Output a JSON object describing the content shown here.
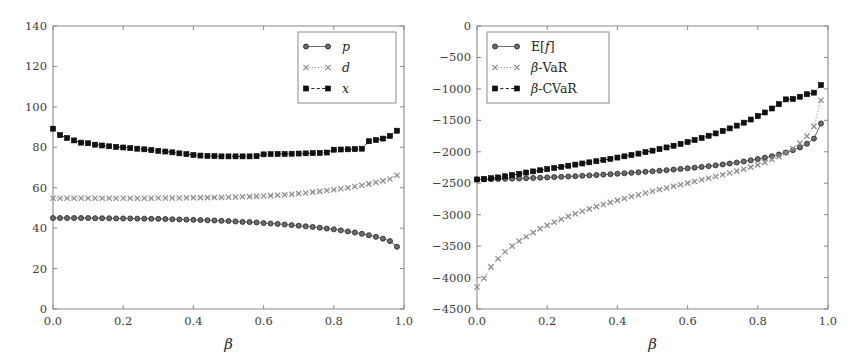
{
  "figure": {
    "background_color": "#ffffff",
    "width": 849,
    "height": 360,
    "panels": 2
  },
  "colors": {
    "axis": "#8a8a8a",
    "tick_text": "#3d3d3d",
    "series_p": "#6d6d6d",
    "series_d": "#8d8d8d",
    "series_x": "#111111",
    "legend_border": "#8a8a8a"
  },
  "chart_data": [
    {
      "type": "line",
      "panel": "left",
      "title": "",
      "xlabel": "β",
      "ylabel": "",
      "xlim": [
        0.0,
        1.0
      ],
      "ylim": [
        0,
        140
      ],
      "xticks": [
        0.0,
        0.2,
        0.4,
        0.6,
        0.8,
        1.0
      ],
      "xtick_labels": [
        "0.0",
        "0.2",
        "0.4",
        "0.6",
        "0.8",
        "1.0"
      ],
      "yticks": [
        0,
        20,
        40,
        60,
        80,
        100,
        120,
        140
      ],
      "ytick_labels": [
        "0",
        "20",
        "40",
        "60",
        "80",
        "100",
        "120",
        "140"
      ],
      "grid": false,
      "legend_position": "upper-right",
      "x": [
        0.0,
        0.02,
        0.04,
        0.06,
        0.08,
        0.1,
        0.12,
        0.14,
        0.16,
        0.18,
        0.2,
        0.22,
        0.24,
        0.26,
        0.28,
        0.3,
        0.32,
        0.34,
        0.36,
        0.38,
        0.4,
        0.42,
        0.44,
        0.46,
        0.48,
        0.5,
        0.52,
        0.54,
        0.56,
        0.58,
        0.6,
        0.62,
        0.64,
        0.66,
        0.68,
        0.7,
        0.72,
        0.74,
        0.76,
        0.78,
        0.8,
        0.82,
        0.84,
        0.86,
        0.88,
        0.9,
        0.92,
        0.94,
        0.96,
        0.98
      ],
      "series": [
        {
          "name": "p",
          "marker": "circle",
          "linestyle": "solid",
          "color": "#6d6d6d",
          "values": [
            45.0,
            45.0,
            45.0,
            45.0,
            45.0,
            45.0,
            44.9,
            44.9,
            44.9,
            44.8,
            44.8,
            44.8,
            44.7,
            44.7,
            44.6,
            44.6,
            44.5,
            44.4,
            44.3,
            44.2,
            44.1,
            44.0,
            43.9,
            43.8,
            43.6,
            43.5,
            43.3,
            43.1,
            43.0,
            42.8,
            42.5,
            42.3,
            42.1,
            41.8,
            41.5,
            41.2,
            40.9,
            40.6,
            40.2,
            39.8,
            39.4,
            38.9,
            38.4,
            37.8,
            37.2,
            36.5,
            35.7,
            34.8,
            33.6,
            30.8
          ]
        },
        {
          "name": "d",
          "marker": "cross",
          "linestyle": "dotted",
          "color": "#8d8d8d",
          "values": [
            54.8,
            54.8,
            54.8,
            54.8,
            54.8,
            54.8,
            54.8,
            54.8,
            54.8,
            54.8,
            54.8,
            54.8,
            54.8,
            54.8,
            54.8,
            54.9,
            54.9,
            54.9,
            54.9,
            55.0,
            55.0,
            55.1,
            55.1,
            55.2,
            55.2,
            55.3,
            55.4,
            55.5,
            55.6,
            55.7,
            55.9,
            56.1,
            56.3,
            56.5,
            56.8,
            57.1,
            57.4,
            57.8,
            58.2,
            58.6,
            59.0,
            59.5,
            60.0,
            60.6,
            61.2,
            61.9,
            62.6,
            63.4,
            64.3,
            66.2
          ]
        },
        {
          "name": "x",
          "marker": "square",
          "linestyle": "dashed",
          "color": "#111111",
          "values": [
            89.2,
            86.0,
            84.6,
            83.4,
            82.3,
            82.0,
            81.3,
            80.9,
            80.5,
            80.2,
            79.9,
            79.6,
            79.3,
            79.0,
            78.6,
            78.2,
            77.9,
            77.5,
            77.0,
            76.6,
            76.2,
            75.9,
            75.7,
            75.6,
            75.5,
            75.5,
            75.5,
            75.5,
            75.5,
            75.6,
            76.5,
            76.6,
            76.7,
            76.7,
            76.8,
            76.9,
            77.0,
            77.1,
            77.2,
            77.4,
            78.8,
            78.9,
            79.0,
            79.1,
            79.3,
            83.0,
            83.6,
            84.3,
            85.6,
            88.2
          ]
        }
      ],
      "legend": [
        {
          "label": "p",
          "italic": true,
          "marker": "circle",
          "linestyle": "solid"
        },
        {
          "label": "d",
          "italic": true,
          "marker": "cross",
          "linestyle": "dotted"
        },
        {
          "label": "x",
          "italic": true,
          "marker": "square",
          "linestyle": "dashed"
        }
      ]
    },
    {
      "type": "line",
      "panel": "right",
      "title": "",
      "xlabel": "β",
      "ylabel": "",
      "xlim": [
        0.0,
        1.0
      ],
      "ylim": [
        -4500,
        0
      ],
      "xticks": [
        0.0,
        0.2,
        0.4,
        0.6,
        0.8,
        1.0
      ],
      "xtick_labels": [
        "0.0",
        "0.2",
        "0.4",
        "0.6",
        "0.8",
        "1.0"
      ],
      "yticks": [
        -4500,
        -4000,
        -3500,
        -3000,
        -2500,
        -2000,
        -1500,
        -1000,
        -500,
        0
      ],
      "ytick_labels": [
        "-4500",
        "-4000",
        "-3500",
        "-3000",
        "-2500",
        "-2000",
        "-1500",
        "-1000",
        "-500",
        "0"
      ],
      "grid": false,
      "legend_position": "upper-left",
      "x": [
        0.0,
        0.02,
        0.04,
        0.06,
        0.08,
        0.1,
        0.12,
        0.14,
        0.16,
        0.18,
        0.2,
        0.22,
        0.24,
        0.26,
        0.28,
        0.3,
        0.32,
        0.34,
        0.36,
        0.38,
        0.4,
        0.42,
        0.44,
        0.46,
        0.48,
        0.5,
        0.52,
        0.54,
        0.56,
        0.58,
        0.6,
        0.62,
        0.64,
        0.66,
        0.68,
        0.7,
        0.72,
        0.74,
        0.76,
        0.78,
        0.8,
        0.82,
        0.84,
        0.86,
        0.88,
        0.9,
        0.92,
        0.94,
        0.96,
        0.98
      ],
      "series": [
        {
          "name": "E[f]",
          "marker": "circle",
          "linestyle": "solid",
          "color": "#6d6d6d",
          "values": [
            -2440,
            -2438,
            -2436,
            -2433,
            -2430,
            -2427,
            -2424,
            -2420,
            -2416,
            -2412,
            -2408,
            -2403,
            -2398,
            -2393,
            -2388,
            -2382,
            -2376,
            -2370,
            -2363,
            -2356,
            -2349,
            -2342,
            -2334,
            -2326,
            -2318,
            -2310,
            -2301,
            -2292,
            -2283,
            -2273,
            -2263,
            -2252,
            -2241,
            -2229,
            -2216,
            -2202,
            -2187,
            -2171,
            -2154,
            -2136,
            -2116,
            -2094,
            -2070,
            -2043,
            -2012,
            -1975,
            -1930,
            -1872,
            -1790,
            -1550
          ]
        },
        {
          "name": "β-VaR",
          "marker": "cross",
          "linestyle": "dotted",
          "color": "#8d8d8d",
          "values": [
            -4150,
            -4010,
            -3830,
            -3700,
            -3590,
            -3500,
            -3420,
            -3350,
            -3285,
            -3225,
            -3170,
            -3120,
            -3072,
            -3028,
            -2986,
            -2946,
            -2908,
            -2872,
            -2838,
            -2805,
            -2773,
            -2742,
            -2712,
            -2683,
            -2655,
            -2628,
            -2601,
            -2575,
            -2549,
            -2523,
            -2498,
            -2472,
            -2446,
            -2420,
            -2393,
            -2366,
            -2338,
            -2308,
            -2277,
            -2244,
            -2208,
            -2168,
            -2124,
            -2074,
            -2016,
            -1947,
            -1862,
            -1752,
            -1596,
            -1180
          ]
        },
        {
          "name": "β-CVaR",
          "marker": "square",
          "linestyle": "dashed",
          "color": "#111111",
          "values": [
            -2440,
            -2432,
            -2420,
            -2408,
            -2390,
            -2370,
            -2350,
            -2330,
            -2312,
            -2294,
            -2276,
            -2258,
            -2240,
            -2222,
            -2204,
            -2186,
            -2168,
            -2150,
            -2131,
            -2112,
            -2092,
            -2072,
            -2051,
            -2029,
            -2006,
            -1982,
            -1957,
            -1931,
            -1904,
            -1875,
            -1845,
            -1813,
            -1780,
            -1745,
            -1708,
            -1669,
            -1628,
            -1584,
            -1537,
            -1487,
            -1433,
            -1375,
            -1312,
            -1243,
            -1167,
            -1160,
            -1125,
            -1085,
            -1060,
            -940
          ]
        }
      ],
      "legend": [
        {
          "label": "E[f]",
          "italic": false,
          "marker": "circle",
          "linestyle": "solid"
        },
        {
          "label": "β-VaR",
          "italic": false,
          "marker": "cross",
          "linestyle": "dotted"
        },
        {
          "label": "β-CVaR",
          "italic": false,
          "marker": "square",
          "linestyle": "dashed"
        }
      ]
    }
  ]
}
